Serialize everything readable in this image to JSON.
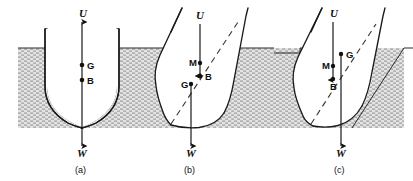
{
  "figure": {
    "width": 413,
    "height": 181,
    "background_color": "#ffffff",
    "water_fill_color": "#d8d8d8",
    "outline_color": "#1a1a1a"
  },
  "panels": [
    {
      "id": "a",
      "caption": "(a)",
      "description": "Upright hull, G above B on the same vertical centerline",
      "labels": {
        "up_force": "U",
        "weight": "W",
        "center_of_gravity": "G",
        "center_of_buoyancy": "B"
      },
      "points": [
        {
          "name": "G",
          "label": "G",
          "x": 82,
          "y": 65
        },
        {
          "name": "B",
          "label": "B",
          "x": 82,
          "y": 80
        }
      ],
      "forces": [
        {
          "name": "U",
          "label": "U",
          "direction": "up",
          "label_x": 84,
          "label_y": 17
        },
        {
          "name": "W",
          "label": "W",
          "direction": "down",
          "label_x": 83,
          "label_y": 153
        }
      ]
    },
    {
      "id": "b",
      "caption": "(b)",
      "description": "Heeled hull, metacentre M above G: righting couple, stable",
      "labels": {
        "up_force": "U",
        "weight": "W",
        "center_of_gravity": "G",
        "center_of_buoyancy": "B",
        "metacentre": "M"
      },
      "points": [
        {
          "name": "M",
          "label": "M",
          "x": 198,
          "y": 63
        },
        {
          "name": "B",
          "label": "B",
          "x": 200,
          "y": 74
        },
        {
          "name": "G",
          "label": "G",
          "x": 191,
          "y": 84
        }
      ],
      "forces": [
        {
          "name": "U",
          "label": "U",
          "direction": "up",
          "label_x": 200,
          "label_y": 19
        },
        {
          "name": "W",
          "label": "W",
          "direction": "down",
          "label_x": 186,
          "label_y": 153
        }
      ]
    },
    {
      "id": "c",
      "caption": "(c)",
      "description": "Heeled hull, metacentre M below G: upsetting couple, unstable",
      "labels": {
        "up_force": "U",
        "weight": "W",
        "center_of_gravity": "G",
        "center_of_buoyancy": "B",
        "metacentre": "M"
      },
      "points": [
        {
          "name": "G",
          "label": "G",
          "x": 341,
          "y": 54
        },
        {
          "name": "M",
          "label": "M",
          "x": 332,
          "y": 66
        },
        {
          "name": "B",
          "label": "B",
          "x": 334,
          "y": 79
        }
      ],
      "forces": [
        {
          "name": "U",
          "label": "U",
          "direction": "up",
          "label_x": 334,
          "label_y": 17
        },
        {
          "name": "W",
          "label": "W",
          "direction": "down",
          "label_x": 337,
          "label_y": 153
        }
      ]
    }
  ],
  "legend_symbols": {
    "U": "Upthrust / buoyant force",
    "W": "Weight of vessel",
    "G": "Centre of gravity",
    "B": "Centre of buoyancy",
    "M": "Metacentre"
  }
}
